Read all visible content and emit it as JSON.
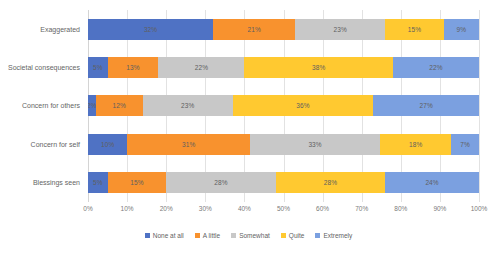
{
  "chart_data": {
    "type": "bar",
    "orientation": "horizontal",
    "stacked": true,
    "normalized": "100%",
    "title": "",
    "subtitle": "",
    "xlabel": "",
    "ylabel": "",
    "xlim": [
      0,
      100
    ],
    "grid": true,
    "legend_position": "bottom",
    "categories": [
      "Exaggerated",
      "Societal consequences",
      "Concern for others",
      "Concern for self",
      "Blessings seen"
    ],
    "xticks": [
      "0%",
      "10%",
      "20%",
      "30%",
      "40%",
      "50%",
      "60%",
      "70%",
      "80%",
      "90%",
      "100%"
    ],
    "xtick_values": [
      0,
      10,
      20,
      30,
      40,
      50,
      60,
      70,
      80,
      90,
      100
    ],
    "series": [
      {
        "name": "None at all",
        "color": "#4F72C4",
        "values": [
          32,
          5,
          2,
          10,
          5
        ],
        "labels": [
          "32%",
          "5%",
          "2%",
          "10%",
          "5%"
        ]
      },
      {
        "name": "A little",
        "color": "#F8922E",
        "values": [
          21,
          13,
          12,
          31,
          15
        ],
        "labels": [
          "21%",
          "13%",
          "12%",
          "31%",
          "15%"
        ]
      },
      {
        "name": "Somewhat",
        "color": "#C8C8C8",
        "values": [
          23,
          22,
          23,
          33,
          28
        ],
        "labels": [
          "23%",
          "22%",
          "23%",
          "33%",
          "28%"
        ]
      },
      {
        "name": "Quite",
        "color": "#FFC930",
        "values": [
          15,
          38,
          36,
          18,
          28
        ],
        "labels": [
          "15%",
          "38%",
          "36%",
          "18%",
          "28%"
        ]
      },
      {
        "name": "Extremely",
        "color": "#7BA0E0",
        "values": [
          9,
          22,
          27,
          7,
          24
        ],
        "labels": [
          "9%",
          "22%",
          "27%",
          "7%",
          "24%"
        ]
      }
    ]
  }
}
